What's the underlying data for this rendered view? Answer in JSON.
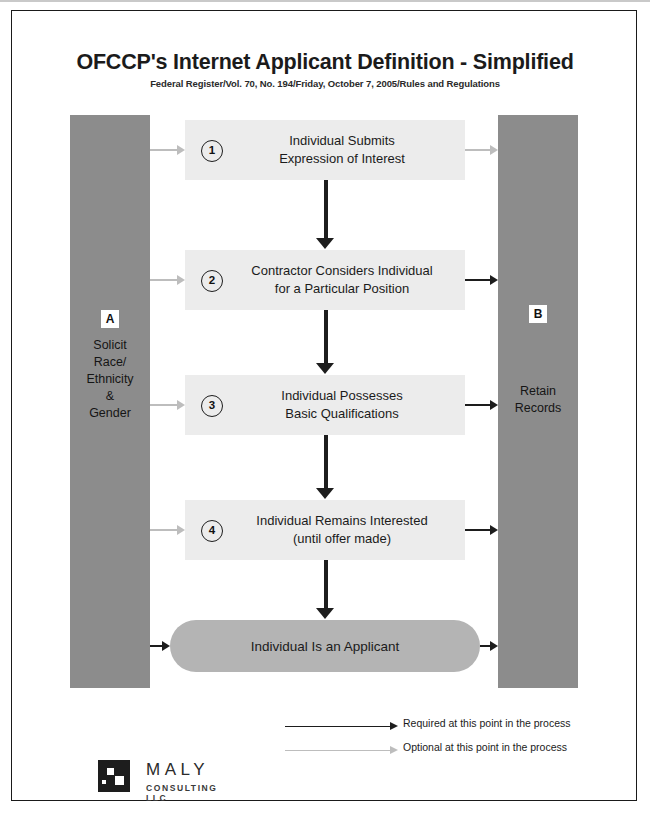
{
  "header": {
    "title": "OFCCP's Internet Applicant Definition - Simplified",
    "subtitle": "Federal Register/Vol. 70, No. 194/Friday, October 7, 2005/Rules and Regulations"
  },
  "columns": {
    "left": {
      "badge": "A",
      "text": "Solicit Race/ Ethnicity & Gender",
      "color": "#8c8c8c"
    },
    "right": {
      "badge": "B",
      "text": "Retain Records",
      "color": "#8c8c8c"
    }
  },
  "steps": [
    {
      "number": "1",
      "text": "Individual Submits Expression of Interest",
      "from_left": "optional",
      "to_right": "optional"
    },
    {
      "number": "2",
      "text": "Contractor Considers Individual for a Particular Position",
      "from_left": "optional",
      "to_right": "required"
    },
    {
      "number": "3",
      "text": "Individual Possesses Basic Qualifications",
      "from_left": "optional",
      "to_right": "required"
    },
    {
      "number": "4",
      "text": "Individual Remains Interested (until offer made)",
      "from_left": "optional",
      "to_right": "required"
    }
  ],
  "final": {
    "text": "Individual Is an Applicant",
    "from_left": "required",
    "to_right": "required",
    "color": "#b4b4b4"
  },
  "legend": [
    {
      "label": "Required at this point in the process",
      "style": "required",
      "color": "#1d1d1d"
    },
    {
      "label": "Optional at this point in the process",
      "style": "optional",
      "color": "#bdbdbd"
    }
  ],
  "logo": {
    "name": "MALY",
    "sub": "CONSULTING LLC",
    "mark": "maly-square-mark"
  }
}
